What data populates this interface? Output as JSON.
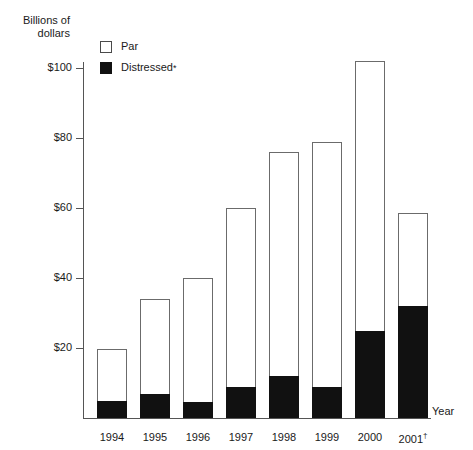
{
  "chart_data": {
    "type": "bar",
    "stacked": true,
    "title": "",
    "xlabel": "Year",
    "ylabel": "Billions of dollars",
    "categories": [
      "1994",
      "1995",
      "1996",
      "1997",
      "1998",
      "1999",
      "2000",
      "2001†"
    ],
    "series": [
      {
        "name": "Distressed*",
        "values": [
          5,
          7,
          4.5,
          9,
          12,
          9,
          25,
          32
        ],
        "color": "#111111"
      },
      {
        "name": "Par",
        "values": [
          14.7,
          27,
          35.5,
          51,
          64,
          70,
          77,
          26.5
        ],
        "color": "#ffffff"
      }
    ],
    "totals": [
      19.7,
      34,
      40,
      60,
      76,
      79,
      102,
      58.5
    ],
    "ylim": [
      0,
      110
    ],
    "yticks": [
      20,
      40,
      60,
      80,
      100
    ],
    "ytick_labels": [
      "$20",
      "$40",
      "$60",
      "$80",
      "$100"
    ],
    "grid": false,
    "legend_position": "top-left"
  },
  "axes": {
    "y_title": "Billions of\ndollars",
    "x_title": "Year"
  },
  "legend": {
    "items": [
      {
        "label": "Par",
        "swatch": "open-square-swatch"
      },
      {
        "label": "Distressed",
        "footnote": "*",
        "swatch": "filled-square-swatch"
      }
    ]
  }
}
